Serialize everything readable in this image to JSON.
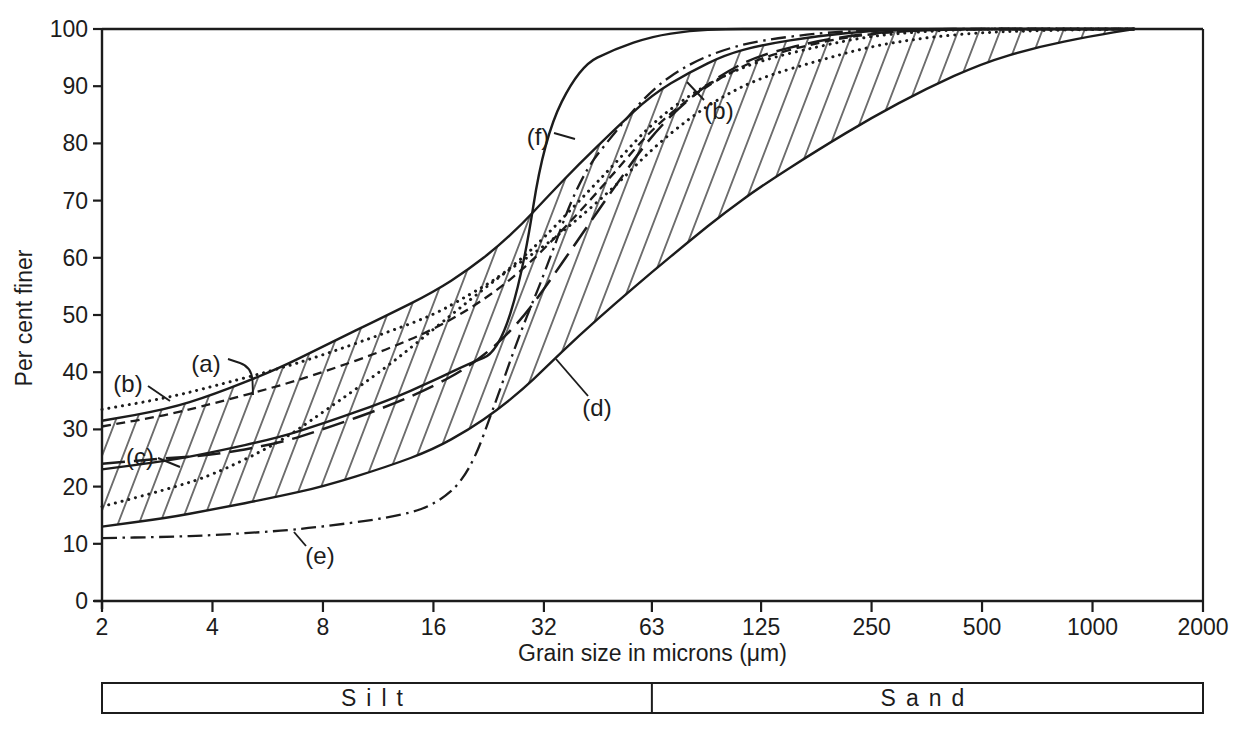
{
  "figure": {
    "background": "#ffffff",
    "ink": "#1c1c1c",
    "y_axis": {
      "title": "Per cent finer",
      "min": 0,
      "max": 100,
      "tick_step": 10,
      "tick_labels": [
        "0",
        "10",
        "20",
        "30",
        "40",
        "50",
        "60",
        "70",
        "80",
        "90",
        "100"
      ]
    },
    "x_axis": {
      "title": "Grain size in microns (μm)",
      "scale": "log2",
      "min": 2,
      "max": 2000,
      "tick_labels": [
        "2",
        "4",
        "8",
        "16",
        "32",
        "63",
        "125",
        "250",
        "500",
        "1000",
        "2000"
      ],
      "tick_values": [
        2,
        4,
        8,
        16,
        32,
        63,
        125,
        250,
        500,
        1000,
        2000
      ]
    },
    "size_class_bar": {
      "boundary_um": 63,
      "left_label": "Silt",
      "right_label": "Sand"
    },
    "annotations": [
      {
        "text": "(b)",
        "x": 128,
        "y": 384,
        "leader": [
          [
            148,
            386
          ],
          [
            170,
            401
          ]
        ]
      },
      {
        "text": "(a)",
        "x": 206,
        "y": 364,
        "leader": [
          [
            228,
            359
          ],
          [
            252,
            367
          ],
          [
            253,
            395
          ]
        ]
      },
      {
        "text": "(c)",
        "x": 140,
        "y": 457,
        "leader": [
          [
            158,
            458
          ],
          [
            180,
            467
          ]
        ]
      },
      {
        "text": "(e)",
        "x": 320,
        "y": 556,
        "leader": [
          [
            294,
            532
          ],
          [
            306,
            546
          ]
        ]
      },
      {
        "text": "(d)",
        "x": 597,
        "y": 408,
        "leader": [
          [
            556,
            359
          ],
          [
            588,
            396
          ]
        ]
      },
      {
        "text": "(f)",
        "x": 538,
        "y": 137,
        "leader": [
          [
            554,
            133
          ],
          [
            575,
            139
          ]
        ]
      },
      {
        "text": "(b)",
        "x": 719,
        "y": 111,
        "leader": [
          [
            704,
            100
          ],
          [
            687,
            82
          ]
        ]
      }
    ]
  },
  "chart_data": {
    "type": "line",
    "xlabel": "Grain size in microns (μm)",
    "ylabel": "Per cent finer",
    "x_scale": "log2",
    "xlim": [
      2,
      2000
    ],
    "ylim": [
      0,
      100
    ],
    "grid": false,
    "legend_position": "none",
    "x_um": [
      2,
      3,
      4,
      6,
      8,
      12,
      16,
      20,
      24,
      28,
      32,
      40,
      50,
      63,
      80,
      100,
      125,
      180,
      250,
      350,
      500,
      700,
      1000,
      1300
    ],
    "envelope": {
      "label": "(d)",
      "fill": "hatched",
      "upper": [
        31.5,
        33.5,
        36,
        40.5,
        44.5,
        50,
        54,
        58,
        62,
        66,
        70,
        76.5,
        82.5,
        88.5,
        92.5,
        95.5,
        97.2,
        98.8,
        99.7,
        100,
        100,
        100,
        100,
        100
      ],
      "lower": [
        13,
        14.5,
        16,
        18.2,
        20,
        23.5,
        26.5,
        30,
        33.5,
        37,
        40.5,
        46.5,
        52,
        57.5,
        63,
        68,
        72.5,
        79,
        84.5,
        89.5,
        94,
        96.8,
        98.8,
        100
      ]
    },
    "series": [
      {
        "name": "curve-c",
        "label": "(c)",
        "style": "long-dash",
        "values": [
          24,
          25,
          25.5,
          27.5,
          30,
          34,
          37.5,
          41,
          45,
          49.5,
          54.5,
          63.5,
          72.5,
          81.5,
          88,
          92.5,
          95.5,
          98,
          99.3,
          99.8,
          100,
          100,
          100,
          100
        ]
      },
      {
        "name": "curve-a",
        "label": "(a)",
        "style": "short-dash",
        "values": [
          30.5,
          32.5,
          34.5,
          37.5,
          40,
          44,
          47.5,
          51,
          54.5,
          58,
          61.5,
          68,
          75,
          82.5,
          88,
          92,
          95,
          97.7,
          99.2,
          99.8,
          100,
          100,
          100,
          100
        ]
      },
      {
        "name": "curve-b-upper",
        "label": "(b)",
        "style": "dotted",
        "values": [
          33.5,
          35.5,
          37.5,
          40.5,
          43,
          47,
          50,
          53.5,
          56.5,
          60,
          63.5,
          70,
          76.5,
          83.5,
          88.5,
          92,
          94.5,
          97,
          98.8,
          99.6,
          100,
          100,
          100,
          100
        ]
      },
      {
        "name": "curve-b-lower",
        "label": "(b)",
        "style": "dotted",
        "values": [
          16.5,
          19.5,
          22,
          27.5,
          33,
          41,
          47.5,
          52.5,
          56.5,
          59.5,
          62,
          67,
          72.5,
          79,
          84.5,
          88.5,
          91.5,
          94.5,
          97,
          98.5,
          99.4,
          99.7,
          99.9,
          100
        ]
      },
      {
        "name": "curve-e",
        "label": "(e)",
        "style": "dash-dot",
        "values": [
          11,
          11.2,
          11.5,
          12.2,
          13,
          14.5,
          16.5,
          22,
          36,
          48,
          57,
          74,
          82,
          89.5,
          94,
          96.5,
          98,
          99.3,
          99.8,
          100,
          100,
          100,
          100,
          100
        ]
      },
      {
        "name": "curve-f",
        "label": "(f)",
        "style": "solid",
        "values": [
          23,
          24.5,
          26,
          28.5,
          31,
          35,
          38.5,
          41.5,
          43.5,
          57,
          81,
          93.5,
          96.5,
          98.7,
          99.7,
          100,
          100,
          100,
          100,
          100,
          100,
          100,
          100,
          100
        ]
      }
    ]
  }
}
